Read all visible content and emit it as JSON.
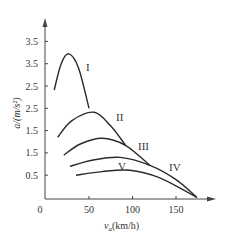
{
  "chart_data": {
    "type": "line",
    "title": "",
    "xlabel": "v_a(km/h)",
    "ylabel": "a/(m/s²)",
    "xlim": [
      0,
      190
    ],
    "ylim": [
      0,
      3.8
    ],
    "grid": false,
    "legend": "inline curve labels",
    "x_ticks": [
      {
        "value": 0,
        "label": "0"
      },
      {
        "value": 50,
        "label": "50"
      },
      {
        "value": 100,
        "label": "100"
      },
      {
        "value": 150,
        "label": "150"
      }
    ],
    "y_ticks": [
      {
        "value": 3.5,
        "label": "3.5"
      },
      {
        "value": 3.0,
        "label": "3.5"
      },
      {
        "value": 2.5,
        "label": "2.5"
      },
      {
        "value": 2.0,
        "label": "2.5"
      },
      {
        "value": 1.5,
        "label": "1.5"
      },
      {
        "value": 1.0,
        "label": "1.5"
      },
      {
        "value": 0.5,
        "label": "0.5"
      }
    ],
    "series": [
      {
        "name": "I",
        "x": [
          10,
          18,
          27,
          38,
          50
        ],
        "y": [
          2.41,
          3.0,
          3.22,
          2.9,
          2.0
        ]
      },
      {
        "name": "II",
        "x": [
          14,
          30,
          56,
          75,
          92
        ],
        "y": [
          1.35,
          1.72,
          1.91,
          1.6,
          1.17
        ]
      },
      {
        "name": "III",
        "x": [
          21,
          40,
          65,
          92,
          120
        ],
        "y": [
          0.95,
          1.2,
          1.33,
          1.17,
          0.72
        ]
      },
      {
        "name": "IV",
        "x": [
          28,
          55,
          86,
          120,
          150,
          174
        ],
        "y": [
          0.7,
          0.84,
          0.9,
          0.72,
          0.4,
          0.0
        ]
      },
      {
        "name": "V",
        "x": [
          35,
          65,
          97,
          130,
          163,
          174
        ],
        "y": [
          0.5,
          0.58,
          0.61,
          0.45,
          0.12,
          0.0
        ]
      }
    ]
  },
  "labels": {
    "y_axis_title": "a/(m/s²)",
    "x_axis_title_main": "v",
    "x_axis_title_sub": "a",
    "x_axis_title_rest": "(km/h)",
    "curve_I": "I",
    "curve_II": "II",
    "curve_III": "III",
    "curve_IV": "IV",
    "curve_V": "V"
  }
}
